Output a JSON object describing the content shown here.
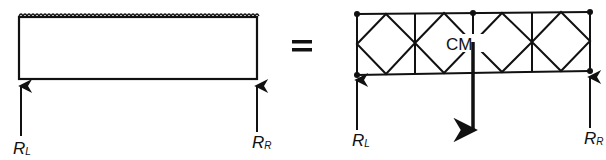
{
  "diagram": {
    "left": {
      "type": "uniformly-loaded-beam",
      "reaction_left": {
        "label": "R",
        "sub": "L"
      },
      "reaction_right": {
        "label": "R",
        "sub": "R"
      }
    },
    "equals": "=",
    "right": {
      "type": "truss",
      "panels": 4,
      "center_of_mass_label": "CM",
      "reaction_left": {
        "label": "R",
        "sub": "L"
      },
      "reaction_right": {
        "label": "R",
        "sub": "R"
      }
    }
  },
  "colors": {
    "ink": "#111111",
    "background": "#ffffff"
  }
}
